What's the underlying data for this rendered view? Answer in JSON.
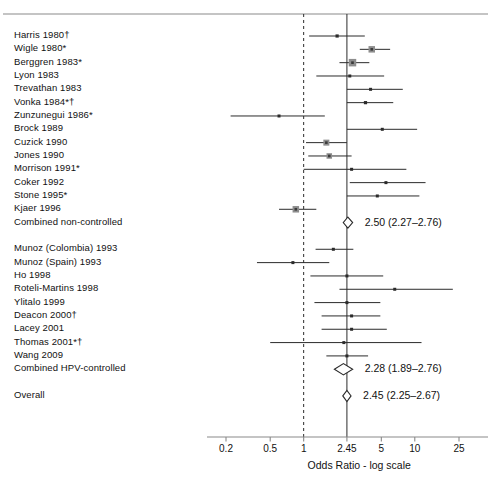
{
  "chart_data": {
    "type": "forest",
    "title": "",
    "xlabel": "Odds Ratio - log scale",
    "ylabel": "",
    "scale": "log",
    "xlim": [
      0.17,
      30
    ],
    "ticks": [
      {
        "value": 0.2,
        "label": "0.2"
      },
      {
        "value": 0.5,
        "label": "0.5"
      },
      {
        "value": 1,
        "label": "1"
      },
      {
        "value": 2.45,
        "label": "2.45"
      },
      {
        "value": 5,
        "label": "5"
      },
      {
        "value": 10,
        "label": "10"
      },
      {
        "value": 25,
        "label": "25"
      }
    ],
    "reference_lines": [
      {
        "value": 1,
        "style": "dashed"
      },
      {
        "value": 2.45,
        "style": "solid"
      }
    ],
    "groups": [
      {
        "name": "non-controlled",
        "studies": [
          {
            "label": "Harris 1980†",
            "or": 2.0,
            "lo": 1.12,
            "hi": 3.55,
            "box": 3.2
          },
          {
            "label": "Wigle 1980*",
            "or": 4.1,
            "lo": 3.2,
            "hi": 6.0,
            "box": 6.5
          },
          {
            "label": "Berggren 1983*",
            "or": 2.75,
            "lo": 2.1,
            "hi": 3.9,
            "box": 7.5
          },
          {
            "label": "Lyon 1983",
            "or": 2.6,
            "lo": 1.3,
            "hi": 5.3,
            "box": 3.0
          },
          {
            "label": "Trevathan 1983",
            "or": 4.0,
            "lo": 2.45,
            "hi": 7.8,
            "box": 3.0
          },
          {
            "label": "Vonka 1984*†",
            "or": 3.6,
            "lo": 2.45,
            "hi": 6.4,
            "box": 3.2
          },
          {
            "label": "Zunzunegui 1986*",
            "or": 0.6,
            "lo": 0.22,
            "hi": 1.55,
            "box": 3.0
          },
          {
            "label": "Brock 1989",
            "or": 5.1,
            "lo": 2.45,
            "hi": 10.5,
            "box": 3.0
          },
          {
            "label": "Cuzick 1990",
            "or": 1.6,
            "lo": 1.05,
            "hi": 2.45,
            "box": 6.0
          },
          {
            "label": "Jones 1990",
            "or": 1.7,
            "lo": 1.1,
            "hi": 2.7,
            "box": 5.5
          },
          {
            "label": "Morrison 1991*",
            "or": 2.7,
            "lo": 1.0,
            "hi": 8.4,
            "box": 3.0
          },
          {
            "label": "Coker 1992",
            "or": 5.5,
            "lo": 2.6,
            "hi": 12.5,
            "box": 3.0
          },
          {
            "label": "Stone 1995*",
            "or": 4.6,
            "lo": 2.45,
            "hi": 11.0,
            "box": 3.0
          },
          {
            "label": "Kjaer 1996",
            "or": 0.85,
            "lo": 0.6,
            "hi": 1.3,
            "box": 6.5
          }
        ],
        "summary": {
          "label": "Combined non-controlled",
          "or": 2.5,
          "lo": 2.27,
          "hi": 2.76,
          "text": "2.50 (2.27–2.76)"
        }
      },
      {
        "name": "HPV-controlled",
        "studies": [
          {
            "label": "Munoz (Colombia) 1993",
            "or": 1.85,
            "lo": 1.28,
            "hi": 2.8,
            "box": 3.0
          },
          {
            "label": "Munoz (Spain) 1993",
            "or": 0.8,
            "lo": 0.38,
            "hi": 1.7,
            "box": 3.0
          },
          {
            "label": "Ho 1998",
            "or": 2.45,
            "lo": 1.15,
            "hi": 5.2,
            "box": 3.0
          },
          {
            "label": "Roteli-Martins 1998",
            "or": 6.6,
            "lo": 2.1,
            "hi": 22.0,
            "box": 3.0
          },
          {
            "label": "Ylitalo 1999",
            "or": 2.45,
            "lo": 1.25,
            "hi": 4.9,
            "box": 3.0
          },
          {
            "label": "Deacon 2000†",
            "or": 2.7,
            "lo": 1.45,
            "hi": 4.9,
            "box": 3.0
          },
          {
            "label": "Lacey 2001",
            "or": 2.7,
            "lo": 1.45,
            "hi": 5.6,
            "box": 3.0
          },
          {
            "label": "Thomas 2001*†",
            "or": 2.3,
            "lo": 0.5,
            "hi": 11.5,
            "box": 3.0
          },
          {
            "label": "Wang 2009",
            "or": 2.45,
            "lo": 1.6,
            "hi": 3.8,
            "box": 3.0
          }
        ],
        "summary": {
          "label": "Combined HPV-controlled",
          "or": 2.28,
          "lo": 1.89,
          "hi": 2.76,
          "text": "2.28 (1.89–2.76)"
        }
      },
      {
        "name": "overall",
        "studies": [],
        "summary": {
          "label": "Overall",
          "or": 2.45,
          "lo": 2.25,
          "hi": 2.67,
          "text": "2.45 (2.25–2.67)"
        }
      }
    ]
  },
  "style": {
    "box_color": "#8d8d8d",
    "line_color": "#2b2b2b",
    "axis_color": "#8a8a8a",
    "text_color": "#111111"
  }
}
